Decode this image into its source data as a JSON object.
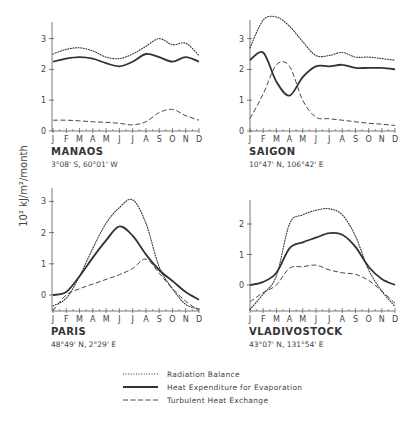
{
  "chart_data": [
    {
      "type": "line",
      "title": "MANAOS",
      "subtitle": "3°08' S, 60°01' W",
      "x": [
        "J",
        "F",
        "M",
        "A",
        "M",
        "J",
        "J",
        "A",
        "S",
        "O",
        "N",
        "D"
      ],
      "ylabel": "10² kJ/m²/month",
      "ylim": [
        0,
        3.5
      ],
      "yticks": [
        0,
        1,
        2,
        3
      ],
      "series": [
        {
          "name": "Radiation Balance",
          "style": "dotted",
          "values": [
            2.5,
            2.65,
            2.7,
            2.6,
            2.4,
            2.35,
            2.5,
            2.75,
            3.0,
            2.8,
            2.85,
            2.45
          ]
        },
        {
          "name": "Heat Expenditure for Evaporation",
          "style": "solid",
          "values": [
            2.25,
            2.35,
            2.4,
            2.35,
            2.2,
            2.1,
            2.25,
            2.5,
            2.4,
            2.25,
            2.4,
            2.25
          ]
        },
        {
          "name": "Turbulent Heat Exchange",
          "style": "dashed",
          "values": [
            0.35,
            0.35,
            0.33,
            0.3,
            0.28,
            0.25,
            0.2,
            0.3,
            0.6,
            0.7,
            0.5,
            0.35
          ]
        }
      ]
    },
    {
      "type": "line",
      "title": "SAIGON",
      "subtitle": "10°47' N, 106°42' E",
      "x": [
        "J",
        "F",
        "M",
        "A",
        "M",
        "J",
        "J",
        "A",
        "S",
        "O",
        "N",
        "D"
      ],
      "ylim": [
        0,
        3.5
      ],
      "yticks": [
        0,
        1,
        2,
        3
      ],
      "series": [
        {
          "name": "Radiation Balance",
          "style": "dotted",
          "values": [
            2.7,
            3.6,
            3.7,
            3.4,
            2.9,
            2.45,
            2.45,
            2.55,
            2.4,
            2.4,
            2.35,
            2.3
          ]
        },
        {
          "name": "Heat Expenditure for Evaporation",
          "style": "solid",
          "values": [
            2.3,
            2.55,
            1.6,
            1.15,
            1.75,
            2.1,
            2.1,
            2.15,
            2.05,
            2.05,
            2.05,
            2.0
          ]
        },
        {
          "name": "Turbulent Heat Exchange",
          "style": "dashed",
          "values": [
            0.4,
            1.2,
            2.15,
            2.1,
            1.0,
            0.45,
            0.4,
            0.35,
            0.3,
            0.25,
            0.22,
            0.18
          ]
        }
      ]
    },
    {
      "type": "line",
      "title": "PARIS",
      "subtitle": "48°49' N, 2°29' E",
      "x": [
        "J",
        "F",
        "M",
        "A",
        "M",
        "J",
        "J",
        "A",
        "S",
        "O",
        "N",
        "D"
      ],
      "ylim": [
        -0.5,
        3.2
      ],
      "yticks": [
        0,
        1,
        2,
        3
      ],
      "series": [
        {
          "name": "Radiation Balance",
          "style": "dotted",
          "values": [
            -0.35,
            -0.1,
            0.6,
            1.5,
            2.3,
            2.8,
            3.05,
            2.3,
            0.9,
            0.2,
            -0.3,
            -0.45
          ]
        },
        {
          "name": "Heat Expenditure for Evaporation",
          "style": "solid",
          "values": [
            0.0,
            0.1,
            0.6,
            1.2,
            1.75,
            2.2,
            1.9,
            1.3,
            0.8,
            0.45,
            0.1,
            -0.15
          ]
        },
        {
          "name": "Turbulent Heat Exchange",
          "style": "dashed",
          "values": [
            -0.5,
            0.0,
            0.2,
            0.35,
            0.5,
            0.65,
            0.85,
            1.15,
            0.7,
            0.2,
            -0.2,
            -0.5
          ]
        }
      ]
    },
    {
      "type": "line",
      "title": "VLADIVOSTOCK",
      "subtitle": "43°07' N, 131°54' E",
      "x": [
        "J",
        "F",
        "M",
        "A",
        "M",
        "J",
        "J",
        "A",
        "S",
        "O",
        "N",
        "D"
      ],
      "ylim": [
        -0.8,
        2.7
      ],
      "yticks": [
        0,
        1,
        2
      ],
      "series": [
        {
          "name": "Radiation Balance",
          "style": "dotted",
          "values": [
            -0.8,
            -0.3,
            0.3,
            2.0,
            2.3,
            2.45,
            2.5,
            2.3,
            1.6,
            0.5,
            -0.2,
            -0.7
          ]
        },
        {
          "name": "Heat Expenditure for Evaporation",
          "style": "solid",
          "values": [
            0.0,
            0.1,
            0.4,
            1.2,
            1.4,
            1.55,
            1.7,
            1.65,
            1.25,
            0.6,
            0.2,
            0.0
          ]
        },
        {
          "name": "Turbulent Heat Exchange",
          "style": "dashed",
          "values": [
            -0.55,
            -0.25,
            0.0,
            0.55,
            0.6,
            0.65,
            0.5,
            0.4,
            0.35,
            0.15,
            -0.2,
            -0.6
          ]
        }
      ]
    }
  ],
  "figure": {
    "ylabel": "10² kJ/m²/month",
    "legend": [
      {
        "label": "Radiation Balance",
        "style": "dotted"
      },
      {
        "label": "Heat Expenditure for Evaporation",
        "style": "solid"
      },
      {
        "label": "Turbulent Heat Exchange",
        "style": "dashed"
      }
    ],
    "colors": {
      "line": "#333333",
      "axis": "#555555"
    }
  }
}
